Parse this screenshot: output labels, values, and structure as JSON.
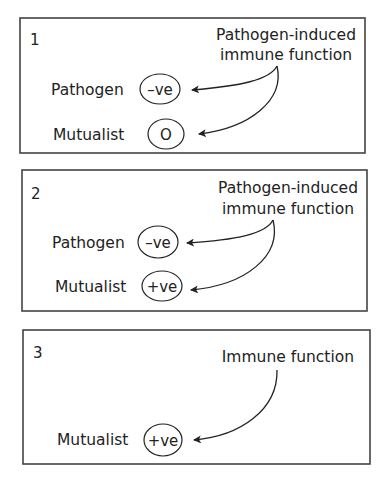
{
  "panels": [
    {
      "number": "1",
      "source_line1": "Pathogen-induced",
      "source_line2": "immune function",
      "targets": [
        {
          "label": "Pathogen",
          "effect": "–ve"
        },
        {
          "label": "Mutualist",
          "effect": "O"
        }
      ]
    },
    {
      "number": "2",
      "source_line1": "Pathogen-induced",
      "source_line2": "immune function",
      "targets": [
        {
          "label": "Pathogen",
          "effect": "–ve"
        },
        {
          "label": "Mutualist",
          "effect": "+ve"
        }
      ]
    },
    {
      "number": "3",
      "source_line1": "Immune function",
      "targets": [
        {
          "label": "Mutualist",
          "effect": "+ve"
        }
      ]
    }
  ],
  "colors": {
    "stroke": "#222222",
    "box": "#444444",
    "background": "#ffffff"
  }
}
